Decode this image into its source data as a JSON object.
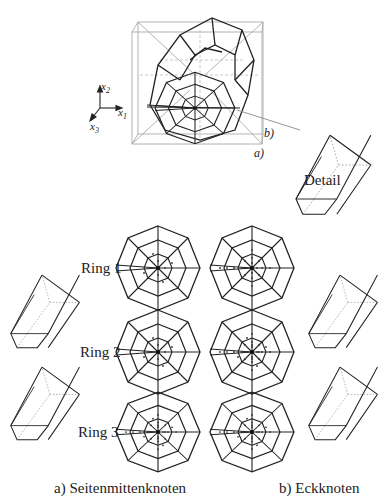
{
  "figure": {
    "axes": {
      "x1": "x",
      "x1_sub": "1",
      "x2": "x",
      "x2_sub": "2",
      "x3": "x",
      "x3_sub": "3"
    },
    "top_labels": {
      "a": "a)",
      "b": "b)",
      "detail": "Detail"
    },
    "rings": [
      {
        "label": "Ring 1"
      },
      {
        "label": "Ring 2"
      },
      {
        "label": "Ring 3"
      }
    ],
    "captions": {
      "left": "a) Seitenmittenknoten",
      "right": "b) Eckknoten"
    }
  }
}
